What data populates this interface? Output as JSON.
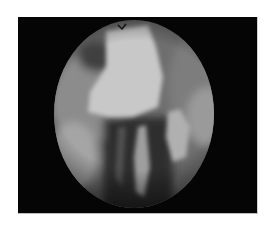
{
  "image": {
    "description": "Grayscale endoscopic view: circular field of view on black rectangular background, white page margin",
    "colors": {
      "page_background": "#ffffff",
      "frame_background": "#050505",
      "tissue_highlight": "#cfcfcf",
      "tissue_mid": "#8a8a8a",
      "tissue_dark": "#2a2a2a"
    },
    "view": {
      "shape": "ellipse",
      "cx": 116,
      "cy": 97,
      "rx": 80,
      "ry": 94
    }
  }
}
